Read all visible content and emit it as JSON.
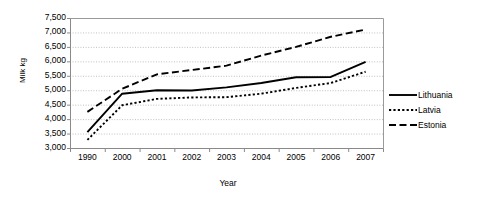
{
  "chart_data": {
    "type": "line",
    "title": "",
    "xlabel": "Year",
    "ylabel": "Milk kg",
    "categories": [
      "1990",
      "2000",
      "2001",
      "2002",
      "2003",
      "2004",
      "2005",
      "2006",
      "2007"
    ],
    "ylim": [
      3000,
      7500
    ],
    "yticks": [
      3000,
      3500,
      4000,
      4500,
      5000,
      5500,
      6000,
      6500,
      7000,
      7500
    ],
    "ytick_labels": [
      "3,000",
      "3,500",
      "4,000",
      "4,500",
      "5,000",
      "5,500",
      "6,000",
      "6,500",
      "7,000",
      "7,500"
    ],
    "grid": true,
    "grid_axis": "y",
    "legend_position": "right",
    "series": [
      {
        "name": "Lithuania",
        "style": "solid",
        "color": "#000000",
        "values": [
          3550,
          4880,
          5000,
          4990,
          5100,
          5250,
          5450,
          5460,
          5980
        ]
      },
      {
        "name": "Latvia",
        "style": "dotted",
        "color": "#000000",
        "values": [
          3280,
          4480,
          4700,
          4750,
          4760,
          4880,
          5080,
          5250,
          5640
        ]
      },
      {
        "name": "Estonia",
        "style": "dashed",
        "color": "#000000",
        "values": [
          4250,
          5050,
          5550,
          5700,
          5850,
          6200,
          6500,
          6850,
          7100
        ]
      }
    ]
  },
  "axes": {
    "y_title": "Milk kg",
    "x_title": "Year"
  },
  "legend": {
    "items": [
      {
        "label": "Lithuania",
        "style": "solid"
      },
      {
        "label": "Latvia",
        "style": "dotted"
      },
      {
        "label": "Estonia",
        "style": "dashed"
      }
    ]
  }
}
